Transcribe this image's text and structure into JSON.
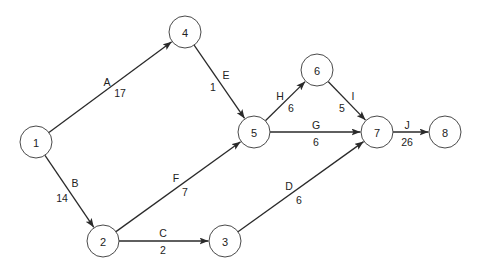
{
  "diagram": {
    "type": "activity-on-arrow network",
    "node_radius": 16,
    "nodes": [
      {
        "id": "1",
        "label": "1",
        "x": 36,
        "y": 142
      },
      {
        "id": "2",
        "label": "2",
        "x": 103,
        "y": 241
      },
      {
        "id": "3",
        "label": "3",
        "x": 225,
        "y": 241
      },
      {
        "id": "4",
        "label": "4",
        "x": 185,
        "y": 32
      },
      {
        "id": "5",
        "label": "5",
        "x": 254,
        "y": 132
      },
      {
        "id": "6",
        "label": "6",
        "x": 317,
        "y": 70
      },
      {
        "id": "7",
        "label": "7",
        "x": 377,
        "y": 132
      },
      {
        "id": "8",
        "label": "8",
        "x": 445,
        "y": 132
      }
    ],
    "edges": [
      {
        "activity": "A",
        "duration": "17",
        "from": "1",
        "to": "4",
        "name_pos": [
          107,
          82
        ],
        "dur_pos": [
          120,
          93
        ]
      },
      {
        "activity": "B",
        "duration": "14",
        "from": "1",
        "to": "2",
        "name_pos": [
          75,
          183
        ],
        "dur_pos": [
          62,
          198
        ]
      },
      {
        "activity": "C",
        "duration": "2",
        "from": "2",
        "to": "3",
        "name_pos": [
          163,
          233
        ],
        "dur_pos": [
          163,
          250
        ]
      },
      {
        "activity": "D",
        "duration": "6",
        "from": "3",
        "to": "7",
        "name_pos": [
          289,
          186
        ],
        "dur_pos": [
          299,
          200
        ]
      },
      {
        "activity": "E",
        "duration": "1",
        "from": "4",
        "to": "5",
        "name_pos": [
          226,
          75
        ],
        "dur_pos": [
          213,
          87
        ]
      },
      {
        "activity": "F",
        "duration": "7",
        "from": "2",
        "to": "5",
        "name_pos": [
          176,
          178
        ],
        "dur_pos": [
          185,
          192
        ]
      },
      {
        "activity": "G",
        "duration": "6",
        "from": "5",
        "to": "7",
        "name_pos": [
          316,
          125
        ],
        "dur_pos": [
          316,
          142
        ]
      },
      {
        "activity": "H",
        "duration": "6",
        "from": "5",
        "to": "6",
        "name_pos": [
          280,
          96
        ],
        "dur_pos": [
          291,
          108
        ]
      },
      {
        "activity": "I",
        "duration": "5",
        "from": "6",
        "to": "7",
        "name_pos": [
          353,
          96
        ],
        "dur_pos": [
          342,
          108
        ]
      },
      {
        "activity": "J",
        "duration": "26",
        "from": "7",
        "to": "8",
        "name_pos": [
          407,
          125
        ],
        "dur_pos": [
          407,
          142
        ]
      }
    ],
    "colors": {
      "stroke": "#2a2a2a",
      "node_stroke": "#4a4a4a",
      "background": "#ffffff",
      "text": "#222222"
    }
  }
}
